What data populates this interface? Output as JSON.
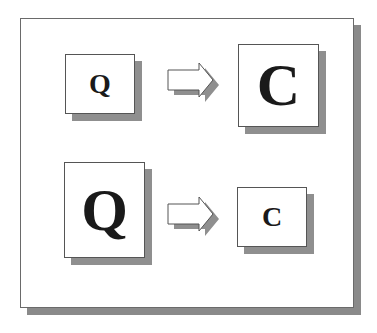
{
  "diagram": {
    "rows": [
      {
        "source": {
          "letter": "Q",
          "size": "small"
        },
        "arrow": "right-arrow",
        "target": {
          "letter": "C",
          "size": "large"
        }
      },
      {
        "source": {
          "letter": "Q",
          "size": "large"
        },
        "arrow": "right-arrow",
        "target": {
          "letter": "C",
          "size": "small"
        }
      }
    ],
    "colors": {
      "shadow": "#8f8f8f",
      "border": "#555555",
      "text": "#1a1a1a",
      "background": "#ffffff"
    }
  }
}
